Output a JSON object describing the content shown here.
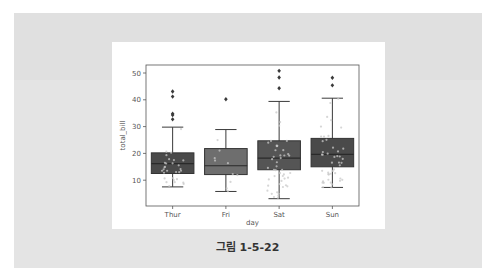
{
  "figure": {
    "caption": "그림 1-5-22"
  },
  "chart_data": {
    "type": "box",
    "title": "",
    "xlabel": "day",
    "ylabel": "total_bill",
    "categories": [
      "Thur",
      "Fri",
      "Sat",
      "Sun"
    ],
    "yticks": [
      10,
      20,
      30,
      40,
      50
    ],
    "ylim": [
      0,
      53
    ],
    "grid": false,
    "legend": null,
    "overlay": "swarm/strip points (light gray) over boxes",
    "boxes": [
      {
        "category": "Thur",
        "whisker_low": 7.5,
        "q1": 12.5,
        "median": 16.2,
        "q3": 20.2,
        "whisker_high": 29.8,
        "outliers": [
          32.7,
          34.3,
          34.8,
          41.2,
          43.1
        ],
        "color": "#4a4a4a"
      },
      {
        "category": "Fri",
        "whisker_low": 5.8,
        "q1": 12.1,
        "median": 15.4,
        "q3": 21.8,
        "whisker_high": 28.9,
        "outliers": [
          40.2
        ],
        "color": "#6e6e6e"
      },
      {
        "category": "Sat",
        "whisker_low": 3.1,
        "q1": 13.9,
        "median": 18.2,
        "q3": 24.7,
        "whisker_high": 39.4,
        "outliers": [
          44.3,
          48.3,
          50.8
        ],
        "color": "#555555"
      },
      {
        "category": "Sun",
        "whisker_low": 7.3,
        "q1": 15.0,
        "median": 19.6,
        "q3": 25.6,
        "whisker_high": 40.6,
        "outliers": [
          45.4,
          48.2
        ],
        "color": "#4a4a4a"
      }
    ]
  }
}
